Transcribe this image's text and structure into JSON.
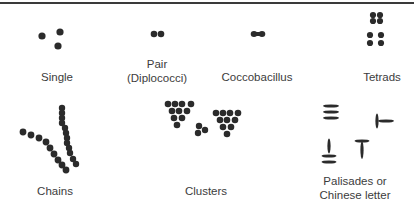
{
  "figure": {
    "ink_color": "#2b2b2b",
    "label_color": "#3c3c3c"
  },
  "arrangements": [
    {
      "id": "single",
      "label_lines": [
        "Single"
      ]
    },
    {
      "id": "pair",
      "label_lines": [
        "Pair",
        "(Diplococci)"
      ]
    },
    {
      "id": "coccobacillus",
      "label_lines": [
        "Coccobacillus"
      ]
    },
    {
      "id": "tetrads",
      "label_lines": [
        "Tetrads"
      ]
    },
    {
      "id": "chains",
      "label_lines": [
        "Chains"
      ]
    },
    {
      "id": "clusters",
      "label_lines": [
        "Clusters"
      ]
    },
    {
      "id": "palisades",
      "label_lines": [
        "Palisades or",
        "Chinese letter"
      ]
    }
  ]
}
